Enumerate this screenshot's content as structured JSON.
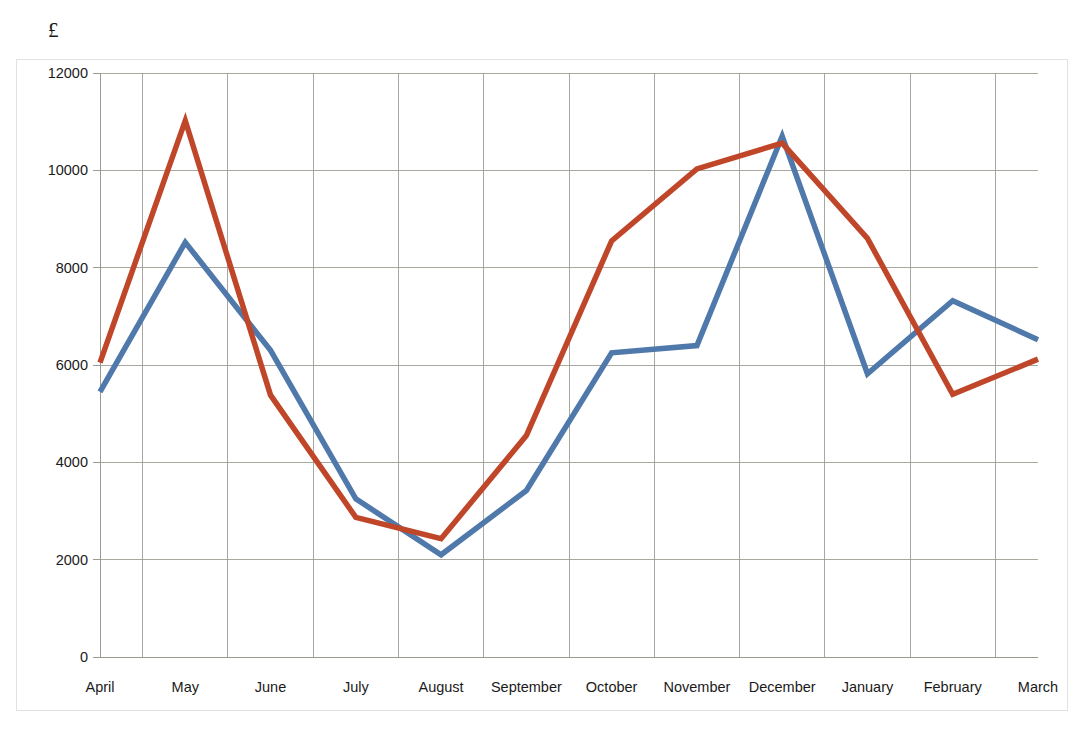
{
  "chart": {
    "currency_unit": "£",
    "ylabel": "",
    "xlabel": ""
  },
  "axis": {
    "y_ticks": [
      "0",
      "2000",
      "4000",
      "6000",
      "8000",
      "10000",
      "12000"
    ],
    "x_ticks": [
      "April",
      "May",
      "June",
      "July",
      "August",
      "September",
      "October",
      "November",
      "December",
      "January",
      "February",
      "March"
    ]
  },
  "colors": {
    "series_1": "#4F78AB",
    "series_2": "#C0462A",
    "gridline": "#9a9a8e",
    "frame": "#e2e2e2",
    "text": "#1a1a1a"
  },
  "chart_data": {
    "type": "line",
    "title": "",
    "subtitle": "",
    "xlabel": "",
    "ylabel": "£",
    "ylim": [
      0,
      12000
    ],
    "ytick_step": 2000,
    "grid": true,
    "legend": "none",
    "categories": [
      "April",
      "May",
      "June",
      "July",
      "August",
      "September",
      "October",
      "November",
      "December",
      "January",
      "February",
      "March"
    ],
    "series": [
      {
        "name": "Series 1",
        "color": "#4F78AB",
        "values": [
          5450,
          8520,
          6300,
          3250,
          2100,
          3420,
          6250,
          6400,
          10700,
          5820,
          7320,
          6520
        ]
      },
      {
        "name": "Series 2",
        "color": "#C0462A",
        "values": [
          6050,
          11020,
          5380,
          2870,
          2430,
          4550,
          8550,
          10030,
          10560,
          8600,
          5400,
          6120
        ]
      }
    ]
  }
}
